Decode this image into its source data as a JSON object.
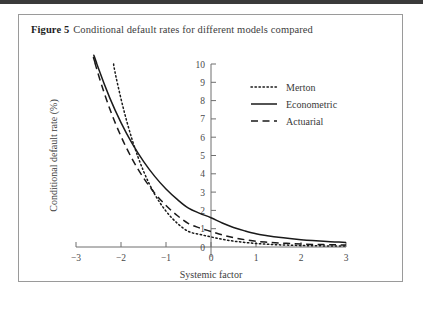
{
  "figure": {
    "label": "Figure 5",
    "caption": "Conditional default rates for different models compared"
  },
  "chart_data": {
    "type": "line",
    "title": "Conditional default rates for different models compared",
    "xlabel": "Systemic factor",
    "ylabel": "Conditional default rate (%)",
    "xlim": [
      -3,
      3
    ],
    "ylim": [
      0,
      10
    ],
    "xticks": [
      -3,
      -2,
      -1,
      0,
      1,
      2,
      3
    ],
    "xtick_labels": [
      "−3",
      "−2",
      "−1",
      "0",
      "1",
      "2",
      "3"
    ],
    "yticks": [
      0,
      1,
      2,
      3,
      4,
      5,
      6,
      7,
      8,
      9,
      10
    ],
    "ytick_labels": [
      "0",
      "1",
      "2",
      "3",
      "4",
      "5",
      "6",
      "7",
      "8",
      "9",
      "10"
    ],
    "grid": false,
    "legend_position": "upper right",
    "x": [
      -3,
      -2.75,
      -2.5,
      -2.25,
      -2,
      -1.75,
      -1.5,
      -1.25,
      -1,
      -0.75,
      -0.5,
      -0.25,
      0,
      0.25,
      0.5,
      0.75,
      1,
      1.25,
      1.5,
      1.75,
      2,
      2.25,
      2.5,
      2.75,
      3
    ],
    "series": [
      {
        "name": "Merton",
        "style": "dotted",
        "values": [
          24.9,
          19.3,
          14.7,
          11.0,
          8.1,
          5.85,
          4.15,
          2.88,
          1.96,
          1.3,
          0.85,
          0.69,
          0.55,
          0.42,
          0.32,
          0.25,
          0.19,
          0.15,
          0.12,
          0.1,
          0.08,
          0.07,
          0.06,
          0.05,
          0.05
        ]
      },
      {
        "name": "Econometric",
        "style": "solid",
        "values": [
          13.8,
          11.6,
          9.75,
          8.15,
          6.8,
          5.65,
          4.68,
          3.86,
          3.17,
          2.6,
          2.12,
          1.84,
          1.6,
          1.31,
          1.07,
          0.88,
          0.72,
          0.62,
          0.53,
          0.46,
          0.4,
          0.35,
          0.31,
          0.28,
          0.25
        ]
      },
      {
        "name": "Actuarial",
        "style": "dashed",
        "values": [
          14.2,
          11.6,
          9.4,
          7.55,
          6.05,
          4.8,
          3.78,
          2.94,
          2.27,
          1.72,
          1.28,
          1.04,
          0.85,
          0.66,
          0.51,
          0.4,
          0.31,
          0.26,
          0.22,
          0.19,
          0.16,
          0.14,
          0.13,
          0.12,
          0.11
        ]
      }
    ]
  },
  "legend": {
    "items": [
      {
        "label": "Merton"
      },
      {
        "label": "Econometric"
      },
      {
        "label": "Actuarial"
      }
    ]
  }
}
